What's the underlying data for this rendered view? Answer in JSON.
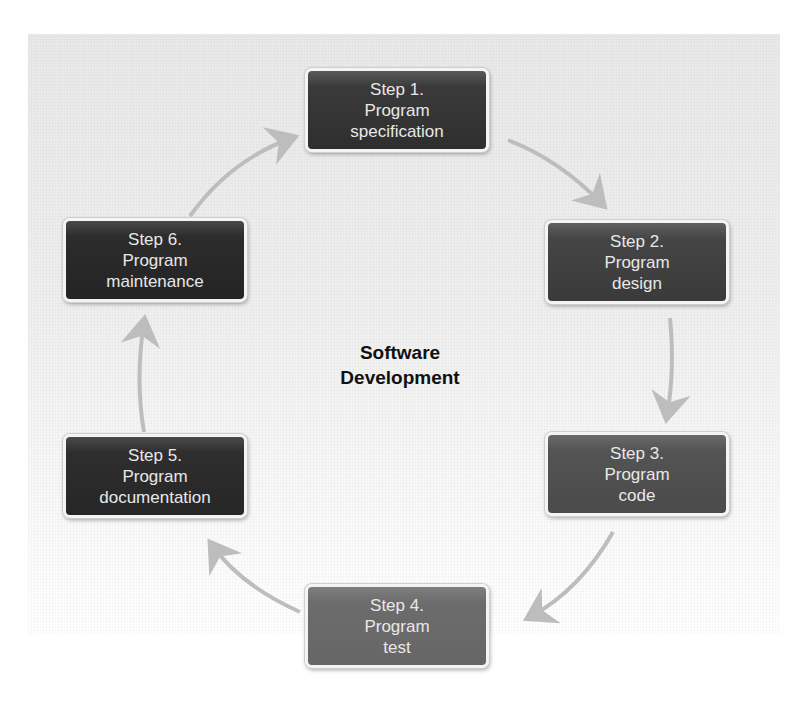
{
  "diagram": {
    "title_lines": [
      "Software",
      "Development"
    ],
    "arrow_color": "#bdbdbd",
    "steps": [
      {
        "number": "Step 1.",
        "line2": "Program",
        "line3": "specification"
      },
      {
        "number": "Step 2.",
        "line2": "Program",
        "line3": "design"
      },
      {
        "number": "Step 3.",
        "line2": "Program",
        "line3": "code"
      },
      {
        "number": "Step 4.",
        "line2": "Program",
        "line3": "test"
      },
      {
        "number": "Step 5.",
        "line2": "Program",
        "line3": "documentation"
      },
      {
        "number": "Step 6.",
        "line2": "Program",
        "line3": "maintenance"
      }
    ],
    "flow": [
      {
        "from": "Step 1.",
        "to": "Step 2."
      },
      {
        "from": "Step 2.",
        "to": "Step 3."
      },
      {
        "from": "Step 3.",
        "to": "Step 4."
      },
      {
        "from": "Step 4.",
        "to": "Step 5."
      },
      {
        "from": "Step 5.",
        "to": "Step 6."
      },
      {
        "from": "Step 6.",
        "to": "Step 1."
      }
    ]
  }
}
